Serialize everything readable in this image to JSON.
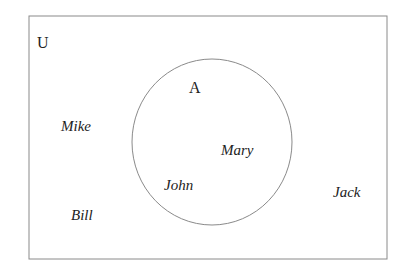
{
  "diagram": {
    "type": "venn",
    "universe": {
      "label": "U"
    },
    "sets": [
      {
        "label": "A",
        "elements": [
          "Mary",
          "John"
        ]
      }
    ],
    "outside_elements": [
      "Mike",
      "Bill",
      "Jack"
    ],
    "colors": {
      "stroke": "#888888",
      "text": "#222222",
      "background": "#ffffff"
    }
  }
}
